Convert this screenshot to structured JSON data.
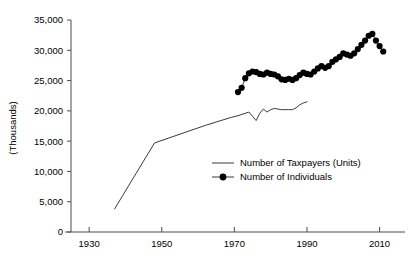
{
  "chart_data": {
    "type": "line",
    "title": "",
    "subtitle": "",
    "xlabel": "",
    "ylabel": "(Thousands)",
    "xlim": [
      1925,
      2017
    ],
    "ylim": [
      0,
      35000
    ],
    "xticks": [
      1930,
      1950,
      1970,
      1990,
      2010
    ],
    "xtick_labels": [
      "1930",
      "1950",
      "1970",
      "1990",
      "2010"
    ],
    "yticks": [
      0,
      5000,
      10000,
      15000,
      20000,
      25000,
      30000,
      35000
    ],
    "ytick_labels": [
      "0",
      "5,000",
      "10,000",
      "15,000",
      "20,000",
      "25,000",
      "30,000",
      "35,000"
    ],
    "grid": false,
    "legend_position": "center-right-inside",
    "series": [
      {
        "name": "Number of Taxpayers (Units)",
        "style": "line",
        "marker": "none",
        "color": "#3a3a3a",
        "x": [
          1937,
          1948,
          1962,
          1969,
          1971,
          1973,
          1974,
          1975,
          1976,
          1977,
          1978,
          1979,
          1980,
          1981,
          1982,
          1983,
          1984,
          1985,
          1986,
          1987,
          1988,
          1989,
          1990
        ],
        "values": [
          3800,
          14700,
          17600,
          18900,
          19200,
          19600,
          19800,
          19100,
          18400,
          19600,
          20300,
          19800,
          20200,
          20400,
          20300,
          20200,
          20200,
          20200,
          20200,
          20500,
          21000,
          21300,
          21500
        ]
      },
      {
        "name": "Number of Individuals",
        "style": "line-marker",
        "marker": "circle",
        "color": "#000000",
        "x": [
          1971,
          1972,
          1973,
          1974,
          1975,
          1976,
          1977,
          1978,
          1979,
          1980,
          1981,
          1982,
          1983,
          1984,
          1985,
          1986,
          1987,
          1988,
          1989,
          1990,
          1991,
          1992,
          1993,
          1994,
          1995,
          1996,
          1997,
          1998,
          1999,
          2000,
          2001,
          2002,
          2003,
          2004,
          2005,
          2006,
          2007,
          2008,
          2009,
          2010,
          2011
        ],
        "values": [
          23100,
          23800,
          25400,
          26200,
          26500,
          26400,
          26100,
          26000,
          26300,
          26100,
          26000,
          25700,
          25200,
          25100,
          25300,
          25100,
          25400,
          25900,
          26300,
          26100,
          26000,
          26500,
          27000,
          27400,
          27100,
          27400,
          28100,
          28500,
          28900,
          29500,
          29300,
          29100,
          29500,
          30200,
          30900,
          31600,
          32400,
          32700,
          31600,
          30700,
          29800
        ]
      }
    ]
  },
  "legend": {
    "entries": [
      {
        "label": "Number of Taxpayers (Units)",
        "marker": "line"
      },
      {
        "label": "Number of Individuals",
        "marker": "line-circle"
      }
    ]
  }
}
